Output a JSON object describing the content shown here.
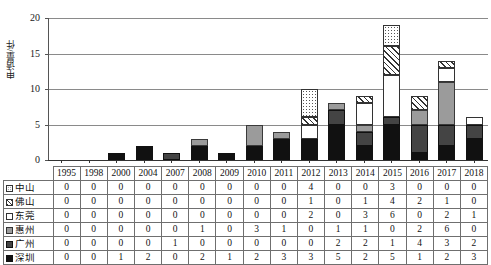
{
  "chart_data": {
    "type": "bar",
    "stacked": true,
    "title": "",
    "xlabel": "",
    "ylabel": "申请量/件",
    "ylim": [
      0,
      20
    ],
    "yticks": [
      0,
      5,
      10,
      15,
      20
    ],
    "grid": true,
    "legend_position": "table-left-column",
    "categories": [
      "1995",
      "1998",
      "2000",
      "2004",
      "2007",
      "2008",
      "2009",
      "2010",
      "2011",
      "2012",
      "2013",
      "2014",
      "2015",
      "2016",
      "2017",
      "2018"
    ],
    "series": [
      {
        "name": "中山",
        "pattern": "dotted",
        "values": [
          0,
          0,
          0,
          0,
          0,
          0,
          0,
          0,
          0,
          4,
          0,
          0,
          3,
          0,
          0,
          0
        ]
      },
      {
        "name": "佛山",
        "pattern": "hatched",
        "values": [
          0,
          0,
          0,
          0,
          0,
          0,
          0,
          0,
          0,
          1,
          0,
          1,
          4,
          2,
          1,
          0
        ]
      },
      {
        "name": "东莞",
        "pattern": "white",
        "values": [
          0,
          0,
          0,
          0,
          0,
          0,
          0,
          0,
          0,
          2,
          0,
          3,
          6,
          0,
          2,
          1
        ]
      },
      {
        "name": "惠州",
        "pattern": "light-gray",
        "values": [
          0,
          0,
          0,
          0,
          0,
          1,
          0,
          3,
          1,
          0,
          1,
          1,
          0,
          2,
          6,
          0
        ]
      },
      {
        "name": "广州",
        "pattern": "dark-gray",
        "values": [
          0,
          0,
          0,
          0,
          1,
          0,
          0,
          0,
          0,
          0,
          2,
          2,
          1,
          4,
          3,
          2
        ]
      },
      {
        "name": "深圳",
        "pattern": "black",
        "values": [
          0,
          0,
          1,
          2,
          0,
          2,
          1,
          2,
          3,
          3,
          5,
          2,
          5,
          1,
          2,
          3
        ]
      }
    ],
    "totals": [
      0,
      0,
      1,
      2,
      1,
      3,
      1,
      5,
      4,
      10,
      8,
      9,
      19,
      9,
      14,
      6
    ]
  },
  "table": {
    "corner_label": "",
    "year_header": [
      "1995",
      "1998",
      "2000",
      "2004",
      "2007",
      "2008",
      "2009",
      "2010",
      "2011",
      "2012",
      "2013",
      "2014",
      "2015",
      "2016",
      "2017",
      "2018"
    ],
    "rows": [
      {
        "label": "中山",
        "swatch": "sw-zhongshan",
        "values": [
          "0",
          "0",
          "0",
          "0",
          "0",
          "0",
          "0",
          "0",
          "0",
          "4",
          "0",
          "0",
          "3",
          "0",
          "0",
          "0"
        ]
      },
      {
        "label": "佛山",
        "swatch": "sw-foshan",
        "values": [
          "0",
          "0",
          "0",
          "0",
          "0",
          "0",
          "0",
          "0",
          "0",
          "1",
          "0",
          "1",
          "4",
          "2",
          "1",
          "0"
        ]
      },
      {
        "label": "东莞",
        "swatch": "sw-dongguan",
        "values": [
          "0",
          "0",
          "0",
          "0",
          "0",
          "0",
          "0",
          "0",
          "0",
          "2",
          "0",
          "3",
          "6",
          "0",
          "2",
          "1"
        ]
      },
      {
        "label": "惠州",
        "swatch": "sw-huizhou",
        "values": [
          "0",
          "0",
          "0",
          "0",
          "0",
          "1",
          "0",
          "3",
          "1",
          "0",
          "1",
          "1",
          "0",
          "2",
          "6",
          "0"
        ]
      },
      {
        "label": "广州",
        "swatch": "sw-guangzhou",
        "values": [
          "0",
          "0",
          "0",
          "0",
          "1",
          "0",
          "0",
          "0",
          "0",
          "0",
          "2",
          "2",
          "1",
          "4",
          "3",
          "2"
        ]
      },
      {
        "label": "深圳",
        "swatch": "sw-shenzhen",
        "values": [
          "0",
          "0",
          "1",
          "2",
          "0",
          "2",
          "1",
          "2",
          "3",
          "3",
          "5",
          "2",
          "5",
          "1",
          "2",
          "3"
        ]
      }
    ]
  },
  "axis": {
    "ylabel": "申请量/件",
    "yticks": [
      "0",
      "5",
      "10",
      "15",
      "20"
    ]
  }
}
